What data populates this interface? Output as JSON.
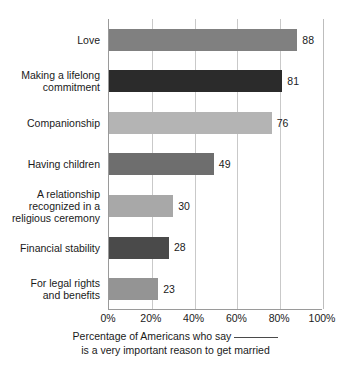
{
  "chart_data": {
    "type": "bar",
    "orientation": "horizontal",
    "title": "",
    "subtitle": "",
    "xlabel": "Percentage of Americans who say ______ is a very important reason to get married",
    "ylabel": "",
    "xlim": [
      0,
      100
    ],
    "xtick_labels": [
      "0%",
      "20%",
      "40%",
      "60%",
      "80%",
      "100%"
    ],
    "xtick_values": [
      0,
      20,
      40,
      60,
      80,
      100
    ],
    "grid": true,
    "grid_axis": "x",
    "legend": false,
    "legend_position": "none",
    "value_labels": true,
    "categories": [
      "Love",
      "Making a lifelong commitment",
      "Companionship",
      "Having children",
      "A relationship recognized in a religious ceremony",
      "Financial stability",
      "For legal rights and benefits"
    ],
    "values": [
      88,
      81,
      76,
      49,
      30,
      28,
      23
    ],
    "bar_colors": [
      "#808080",
      "#2b2b2b",
      "#b4b4b4",
      "#6e6e6e",
      "#a8a8a8",
      "#4a4a4a",
      "#949494"
    ]
  },
  "bars": [
    {
      "label_lines": [
        "Love"
      ],
      "value": 88,
      "value_label": "88",
      "color": "#808080"
    },
    {
      "label_lines": [
        "Making a lifelong",
        "commitment"
      ],
      "value": 81,
      "value_label": "81",
      "color": "#2b2b2b"
    },
    {
      "label_lines": [
        "Companionship"
      ],
      "value": 76,
      "value_label": "76",
      "color": "#b4b4b4"
    },
    {
      "label_lines": [
        "Having children"
      ],
      "value": 49,
      "value_label": "49",
      "color": "#6e6e6e"
    },
    {
      "label_lines": [
        "A relationship",
        "recognized in a",
        "religious ceremony"
      ],
      "value": 30,
      "value_label": "30",
      "color": "#a8a8a8"
    },
    {
      "label_lines": [
        "Financial stability"
      ],
      "value": 28,
      "value_label": "28",
      "color": "#4a4a4a"
    },
    {
      "label_lines": [
        "For legal rights",
        "and benefits"
      ],
      "value": 23,
      "value_label": "23",
      "color": "#949494"
    }
  ],
  "axis": {
    "ticks": [
      {
        "label": "0%",
        "value": 0
      },
      {
        "label": "20%",
        "value": 20
      },
      {
        "label": "40%",
        "value": 40
      },
      {
        "label": "60%",
        "value": 60
      },
      {
        "label": "80%",
        "value": 80
      },
      {
        "label": "100%",
        "value": 100
      }
    ]
  },
  "caption": {
    "line1_prefix": "Percentage of Americans who say",
    "line2": "is a very important reason to get married"
  },
  "colors": {
    "background": "#ffffff",
    "text": "#1a1a1a",
    "gridline": "#c9c9c9",
    "axis_line": "#9a9a9a"
  }
}
